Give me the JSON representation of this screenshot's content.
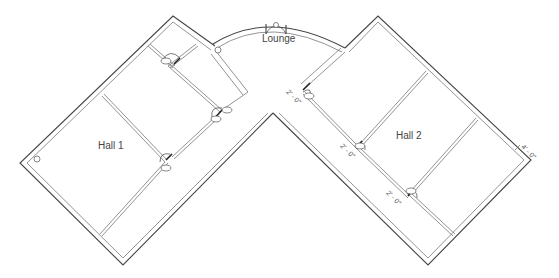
{
  "plan": {
    "rooms": [
      {
        "id": "lounge",
        "label": "Lounge"
      },
      {
        "id": "hall1",
        "label": "Hall 1"
      },
      {
        "id": "hall2",
        "label": "Hall 2"
      }
    ],
    "dimensions": [
      {
        "id": "dim1",
        "label": "2' - 0\""
      },
      {
        "id": "dim2",
        "label": "2' - 0\""
      },
      {
        "id": "dim3",
        "label": "2' - 0\""
      },
      {
        "id": "dim4",
        "label": "4' - 0\""
      }
    ],
    "colors": {
      "wall": "#444444",
      "partition": "#777777",
      "text": "#444444",
      "background": "#ffffff"
    }
  }
}
